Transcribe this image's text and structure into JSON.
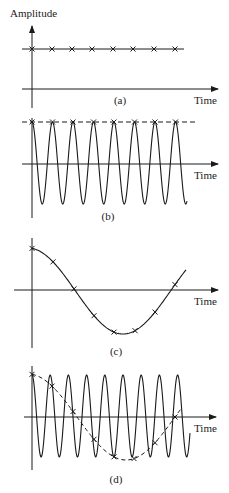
{
  "y_axis_label": "Amplitude",
  "x_axis_label": "Time",
  "panels": [
    {
      "id": "a",
      "caption": "(a)",
      "description": "Constant amplitude with sample markers"
    },
    {
      "id": "b",
      "caption": "(b)",
      "description": "High-frequency sinusoid sampled at peaks; dashed line through samples"
    },
    {
      "id": "c",
      "caption": "(c)",
      "description": "Low-frequency cosine with sample markers"
    },
    {
      "id": "d",
      "caption": "(d)",
      "description": "High-frequency sinusoid with dashed alias curve through samples"
    }
  ],
  "colors": {
    "ink": "#1a1a1a",
    "background": "#ffffff"
  }
}
